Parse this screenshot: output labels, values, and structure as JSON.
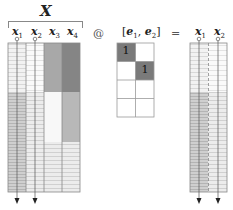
{
  "diagram": {
    "title": "X",
    "operator_at": "@",
    "operator_eq": "=",
    "matrix_x": {
      "columns": [
        {
          "label": "x",
          "sub": "1",
          "shade": "striped-light",
          "selected": true
        },
        {
          "label": "x",
          "sub": "2",
          "shade": "striped-very-light",
          "selected": true
        },
        {
          "label": "x",
          "sub": "3",
          "shade": "medium-gray-top",
          "selected": false
        },
        {
          "label": "x",
          "sub": "4",
          "shade": "dark-gray-top",
          "selected": false
        }
      ]
    },
    "selector": {
      "label_open": "[",
      "e1": "e",
      "e1_sub": "1",
      "comma": ", ",
      "e2": "e",
      "e2_sub": "2",
      "label_close": "]",
      "rows": 4,
      "cols": 2,
      "cells": [
        [
          "1",
          ""
        ],
        [
          "",
          "1"
        ],
        [
          "",
          ""
        ],
        [
          "",
          ""
        ]
      ]
    },
    "result": {
      "columns": [
        {
          "label": "x",
          "sub": "1"
        },
        {
          "label": "x",
          "sub": "2"
        }
      ]
    },
    "colors": {
      "grid_line": "#888888",
      "selected_cell": "#7a7a7a",
      "col3_top": "#a8a8a8",
      "col4_top": "#858585",
      "arrow": "#222222"
    }
  }
}
